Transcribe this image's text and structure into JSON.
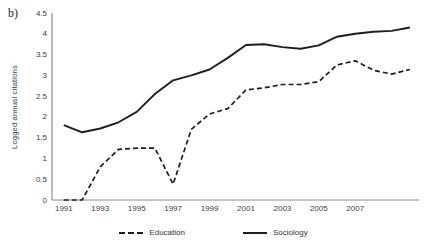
{
  "panel_label": "b)",
  "chart_data": {
    "type": "line",
    "title": "",
    "xlabel": "",
    "ylabel": "Logged annual citations",
    "x": [
      1991,
      1992,
      1993,
      1994,
      1995,
      1996,
      1997,
      1998,
      1999,
      2000,
      2001,
      2002,
      2003,
      2004,
      2005,
      2006,
      2007,
      2008,
      2009,
      2010
    ],
    "series": [
      {
        "name": "Education",
        "style": "dashed",
        "color": "#1f1f1f",
        "values": [
          0,
          0,
          0.8,
          1.22,
          1.25,
          1.25,
          0.38,
          1.7,
          2.07,
          2.2,
          2.65,
          2.7,
          2.78,
          2.78,
          2.85,
          3.25,
          3.35,
          3.12,
          3.03,
          3.14
        ]
      },
      {
        "name": "Sociology",
        "style": "solid",
        "color": "#1f1f1f",
        "values": [
          1.8,
          1.63,
          1.72,
          1.87,
          2.12,
          2.55,
          2.88,
          3.0,
          3.14,
          3.42,
          3.73,
          3.75,
          3.68,
          3.64,
          3.72,
          3.93,
          4.0,
          4.05,
          4.07,
          4.15
        ]
      }
    ],
    "ylim": [
      0,
      4.5
    ],
    "ytick_step": 0.5,
    "xticks": [
      1991,
      1993,
      1995,
      1997,
      1999,
      2001,
      2003,
      2005,
      2007
    ],
    "grid": "off",
    "legend_position": "bottom-center",
    "axis_color": "#8c8c8c",
    "tick_label_color": "#3d3d3d"
  }
}
